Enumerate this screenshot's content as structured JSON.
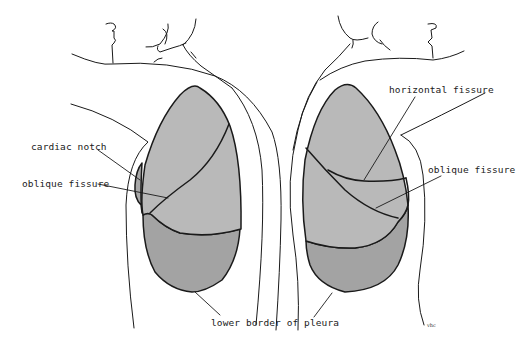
{
  "figure": {
    "colors": {
      "background": "#ffffff",
      "outline": "#1a1a1a",
      "upper_lobe": "#b9b9b9",
      "middle_lobe": "#b9b9b9",
      "lower_lobe": "#a3a3a3",
      "cardiac_notch": "#a8a8a8"
    }
  },
  "labels": {
    "cardiac_notch": "cardiac notch",
    "oblique_fissure_left": "oblique fissure",
    "horizontal_fissure": "horizontal fissure",
    "oblique_fissure_right": "oblique fissure",
    "lower_border_of_pleura": "lower border of pleura",
    "signature": "vhc"
  },
  "views": [
    {
      "side": "left",
      "structures": [
        "upper lobe",
        "lower lobe",
        "cardiac notch",
        "oblique fissure",
        "pleura"
      ]
    },
    {
      "side": "right",
      "structures": [
        "upper lobe",
        "middle lobe",
        "lower lobe",
        "horizontal fissure",
        "oblique fissure",
        "pleura"
      ]
    }
  ]
}
